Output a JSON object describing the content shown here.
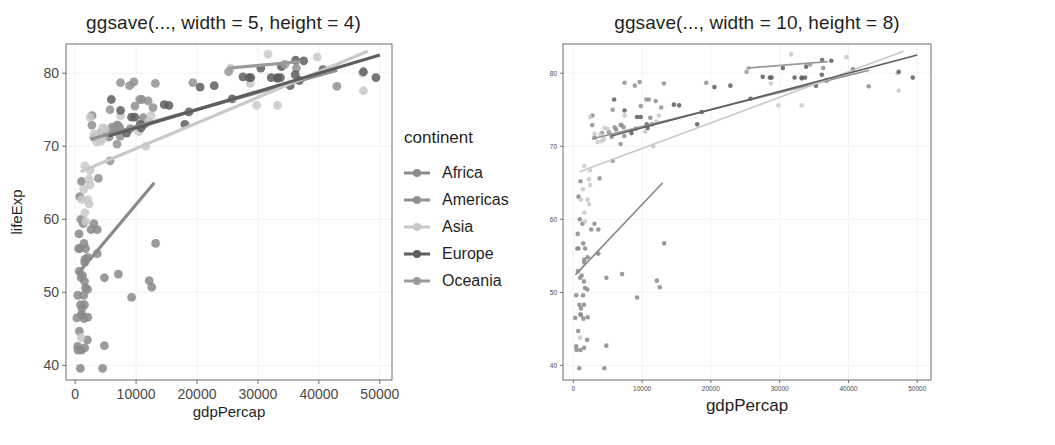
{
  "figures": [
    {
      "id": "left",
      "title": "ggsave(..., width = 5, height = 4)",
      "legend_title": "continent",
      "axis": {
        "xlabel": "gdpPercap",
        "ylabel": "lifeExp",
        "xticks": [
          "0",
          "10000",
          "20000",
          "30000",
          "40000",
          "50000"
        ],
        "yticks": [
          "40",
          "50",
          "60",
          "70",
          "80"
        ]
      }
    },
    {
      "id": "right",
      "title": "ggsave(..., width = 10, height = 8)",
      "legend_title": "continent",
      "axis": {
        "xlabel": "gdpPercap",
        "ylabel": "lifeExp",
        "xticks": [
          "0",
          "10000",
          "20000",
          "30000",
          "40000",
          "50000"
        ],
        "yticks": [
          "40",
          "50",
          "60",
          "70",
          "80"
        ]
      }
    }
  ],
  "legend_entries": [
    {
      "label": "Africa",
      "color": "#8a8a8a"
    },
    {
      "label": "Americas",
      "color": "#909090"
    },
    {
      "label": "Asia",
      "color": "#c9c9c9"
    },
    {
      "label": "Europe",
      "color": "#5e5e5e"
    },
    {
      "label": "Oceania",
      "color": "#9a9a9a"
    }
  ],
  "chart_data": {
    "type": "scatter",
    "xlabel": "gdpPercap",
    "ylabel": "lifeExp",
    "xlim": [
      -1500,
      52000
    ],
    "ylim": [
      38,
      84
    ],
    "xticks": [
      0,
      10000,
      20000,
      30000,
      40000,
      50000
    ],
    "yticks": [
      40,
      50,
      60,
      70,
      80
    ],
    "grid": true,
    "legend": {
      "title": "continent",
      "position": "right"
    },
    "series": [
      {
        "name": "Africa",
        "color": "#8a8a8a",
        "points": [
          [
            6223,
            72.3
          ],
          [
            4797,
            42.7
          ],
          [
            1441,
            56.7
          ],
          [
            12570,
            50.7
          ],
          [
            1217,
            52.3
          ],
          [
            430,
            49.6
          ],
          [
            2042,
            50.4
          ],
          [
            706,
            44.7
          ],
          [
            1704,
            50.6
          ],
          [
            986,
            52.0
          ],
          [
            277,
            46.5
          ],
          [
            3632,
            55.3
          ],
          [
            1544,
            48.3
          ],
          [
            2082,
            54.8
          ],
          [
            5581,
            71.3
          ],
          [
            12154,
            51.6
          ],
          [
            641,
            58.0
          ],
          [
            690,
            52.9
          ],
          [
            13206,
            56.7
          ],
          [
            752,
            56.0
          ],
          [
            1327,
            59.4
          ],
          [
            942,
            60.0
          ],
          [
            579,
            56.0
          ],
          [
            1463,
            46.4
          ],
          [
            1569,
            54.1
          ],
          [
            414,
            42.6
          ],
          [
            11186,
            73.9
          ],
          [
            3080,
            59.4
          ],
          [
            2773,
            74.2
          ],
          [
            3095,
            71.2
          ],
          [
            4811,
            52.0
          ],
          [
            1091,
            46.9
          ],
          [
            1042,
            47.0
          ],
          [
            863,
            39.6
          ],
          [
            1714,
            56.0
          ],
          [
            2082,
            46.6
          ],
          [
            1044,
            65.2
          ],
          [
            759,
            63.1
          ],
          [
            1042,
            42.1
          ],
          [
            1569,
            42.4
          ],
          [
            9269,
            49.3
          ],
          [
            2602,
            58.6
          ],
          [
            4513,
            39.6
          ],
          [
            1107,
            47.8
          ],
          [
            882,
            48.3
          ],
          [
            1598,
            54.5
          ],
          [
            1544,
            51.5
          ],
          [
            469,
            42.1
          ],
          [
            1418,
            49.6
          ],
          [
            3632,
            58.6
          ],
          [
            7093,
            52.5
          ],
          [
            2013,
            43.5
          ]
        ],
        "fit_line": {
          "x": [
            300,
            13000
          ],
          "y": [
            52.4,
            65.0
          ]
        }
      },
      {
        "name": "Americas",
        "color": "#909090",
        "points": [
          [
            12779,
            75.3
          ],
          [
            3822,
            65.6
          ],
          [
            9066,
            72.4
          ],
          [
            36319,
            80.7
          ],
          [
            13171,
            78.6
          ],
          [
            7006,
            72.9
          ],
          [
            9645,
            78.8
          ],
          [
            8948,
            78.3
          ],
          [
            6873,
            72.9
          ],
          [
            5728,
            75.0
          ],
          [
            5186,
            71.9
          ],
          [
            6025,
            72.6
          ],
          [
            6873,
            70.3
          ],
          [
            5728,
            68.0
          ],
          [
            7320,
            72.6
          ],
          [
            11978,
            76.2
          ],
          [
            2749,
            72.9
          ],
          [
            9809,
            75.5
          ],
          [
            4172,
            71.8
          ],
          [
            7408,
            71.4
          ],
          [
            19329,
            78.7
          ],
          [
            7448,
            78.7
          ],
          [
            10611,
            76.4
          ],
          [
            42952,
            78.2
          ],
          [
            10967,
            76.4
          ],
          [
            11416,
            73.0
          ]
        ],
        "fit_line": {
          "x": [
            2700,
            43000
          ],
          "y": [
            71.0,
            80.4
          ]
        }
      },
      {
        "name": "Asia",
        "color": "#c9c9c9",
        "points": [
          [
            974,
            43.8
          ],
          [
            29796,
            75.6
          ],
          [
            1391,
            64.1
          ],
          [
            1713,
            59.7
          ],
          [
            4959,
            72.4
          ],
          [
            39725,
            82.2
          ],
          [
            2452,
            64.7
          ],
          [
            3541,
            70.6
          ],
          [
            11606,
            70.0
          ],
          [
            4471,
            71.0
          ],
          [
            25523,
            80.7
          ],
          [
            31656,
            82.6
          ],
          [
            4519,
            72.5
          ],
          [
            1593,
            67.3
          ],
          [
            12450,
            74.2
          ],
          [
            33207,
            75.6
          ],
          [
            2280,
            65.5
          ],
          [
            1091,
            62.7
          ],
          [
            47307,
            77.6
          ],
          [
            3095,
            71.7
          ],
          [
            2441,
            66.7
          ],
          [
            3970,
            71.6
          ],
          [
            4184,
            70.7
          ],
          [
            28718,
            78.6
          ],
          [
            7458,
            74.2
          ],
          [
            2280,
            62.1
          ],
          [
            47143,
            80.0
          ],
          [
            10461,
            72.0
          ],
          [
            2441,
            74.0
          ],
          [
            2082,
            62.7
          ],
          [
            1593,
            60.9
          ],
          [
            12057,
            73.4
          ]
        ],
        "fit_line": {
          "x": [
            900,
            48000
          ],
          "y": [
            66.5,
            83.0
          ]
        }
      },
      {
        "name": "Europe",
        "color": "#5e5e5e",
        "points": [
          [
            5937,
            76.4
          ],
          [
            36126,
            79.8
          ],
          [
            33693,
            79.4
          ],
          [
            7446,
            74.9
          ],
          [
            10681,
            73.0
          ],
          [
            14619,
            75.7
          ],
          [
            22833,
            78.3
          ],
          [
            35278,
            78.3
          ],
          [
            33207,
            79.3
          ],
          [
            30470,
            80.7
          ],
          [
            32170,
            79.4
          ],
          [
            27538,
            79.5
          ],
          [
            18009,
            73.0
          ],
          [
            36180,
            81.8
          ],
          [
            40676,
            80.5
          ],
          [
            28570,
            79.4
          ],
          [
            9254,
            74.0
          ],
          [
            36798,
            79.0
          ],
          [
            49357,
            79.4
          ],
          [
            47307,
            80.2
          ],
          [
            15389,
            75.6
          ],
          [
            20510,
            78.1
          ],
          [
            10808,
            72.5
          ],
          [
            9786,
            74.0
          ],
          [
            18678,
            74.7
          ],
          [
            25768,
            76.5
          ],
          [
            28821,
            79.4
          ],
          [
            33859,
            80.9
          ],
          [
            37506,
            81.7
          ],
          [
            8458,
            71.8
          ],
          [
            33203,
            79.4
          ]
        ],
        "fit_line": {
          "x": [
            5500,
            50000
          ],
          "y": [
            71.4,
            82.5
          ]
        }
      },
      {
        "name": "Oceania",
        "color": "#9a9a9a",
        "points": [
          [
            34435,
            81.2
          ],
          [
            25185,
            80.2
          ]
        ],
        "fit_line": {
          "x": [
            25185,
            37000
          ],
          "y": [
            80.7,
            81.6
          ]
        }
      }
    ]
  }
}
